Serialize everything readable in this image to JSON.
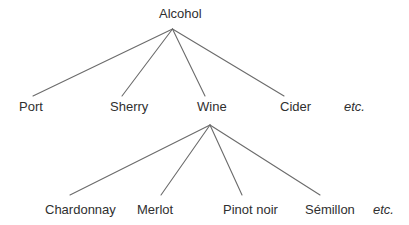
{
  "diagram": {
    "root": {
      "label": "Alcohol"
    },
    "level1": [
      {
        "label": "Port"
      },
      {
        "label": "Sherry"
      },
      {
        "label": "Wine"
      },
      {
        "label": "Cider"
      },
      {
        "label": "etc."
      }
    ],
    "level2": [
      {
        "label": "Chardonnay"
      },
      {
        "label": "Merlot"
      },
      {
        "label": "Pinot noir"
      },
      {
        "label": "Sémillon"
      },
      {
        "label": "etc."
      }
    ],
    "colors": {
      "background": "#ffffff",
      "line": "#6b6b6b",
      "text": "#2f2f2f"
    }
  }
}
